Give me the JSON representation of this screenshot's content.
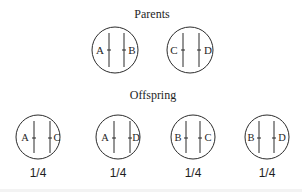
{
  "colors": {
    "background": "#ffffff",
    "stroke": "#2b2b2b",
    "text": "#1e1e1e"
  },
  "parents": {
    "title": "Parents",
    "cells": [
      {
        "left_allele": "A",
        "right_allele": "B"
      },
      {
        "left_allele": "C",
        "right_allele": "D"
      }
    ]
  },
  "offspring": {
    "title": "Offspring",
    "cells": [
      {
        "left_allele": "A",
        "right_allele": "C",
        "probability": "1/4"
      },
      {
        "left_allele": "A",
        "right_allele": "D",
        "probability": "1/4"
      },
      {
        "left_allele": "B",
        "right_allele": "C",
        "probability": "1/4"
      },
      {
        "left_allele": "B",
        "right_allele": "D",
        "probability": "1/4"
      }
    ]
  }
}
